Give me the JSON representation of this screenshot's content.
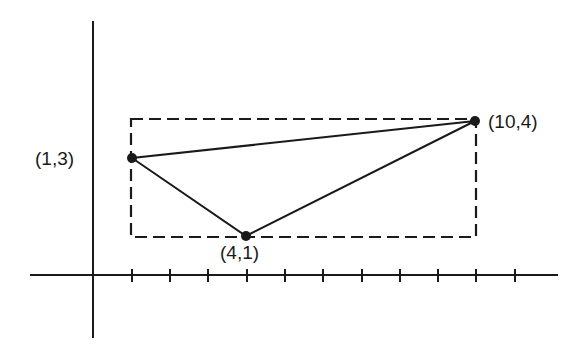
{
  "diagram": {
    "axes": {
      "x_ticks": [
        1,
        2,
        3,
        4,
        5,
        6,
        7,
        8,
        9,
        10,
        11
      ],
      "y_ticks": []
    },
    "points": [
      {
        "id": "A",
        "x": 1,
        "y": 3,
        "label": "(1,3)"
      },
      {
        "id": "B",
        "x": 4,
        "y": 1,
        "label": "(4,1)"
      },
      {
        "id": "C",
        "x": 10,
        "y": 4,
        "label": "(10,4)"
      }
    ],
    "triangle": [
      "A",
      "B",
      "C"
    ],
    "bounding_rectangle": {
      "x_min": 1,
      "x_max": 10,
      "y_min": 1,
      "y_max": 4,
      "style": "dashed"
    },
    "colors": {
      "ink": "#1a1a1a",
      "background": "#ffffff"
    }
  }
}
